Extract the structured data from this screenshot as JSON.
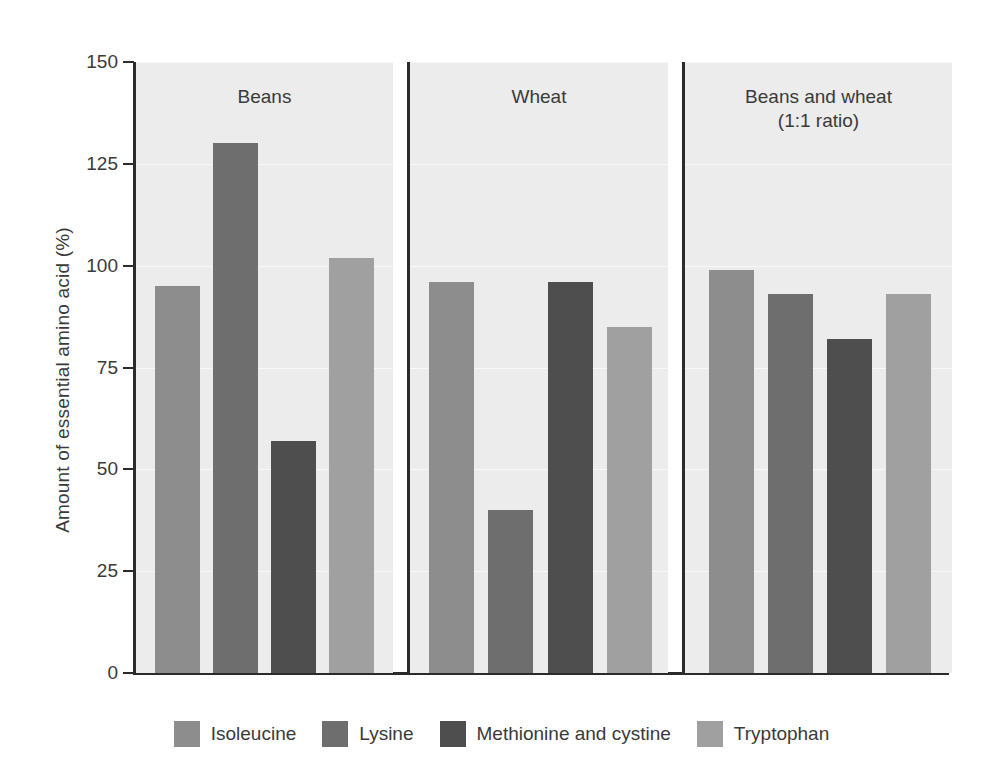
{
  "chart_data": {
    "type": "bar",
    "title": "",
    "xlabel": "",
    "ylabel": "Amount of essential amino acid (%)",
    "ylim": [
      0,
      150
    ],
    "yticks": [
      0,
      25,
      50,
      75,
      100,
      125,
      150
    ],
    "ytick_labels": [
      "0",
      "25",
      "50",
      "75",
      "100",
      "125",
      "150"
    ],
    "grid": true,
    "grid_axis": "y",
    "legend_position": "bottom",
    "panels": [
      "Beans",
      "Wheat",
      "Beans and wheat\n(1:1 ratio)"
    ],
    "categories": [
      "Beans",
      "Wheat",
      "Beans and wheat (1:1 ratio)"
    ],
    "series": [
      {
        "name": "Isoleucine",
        "color": "#8d8d8d",
        "values": [
          95,
          96,
          99
        ]
      },
      {
        "name": "Lysine",
        "color": "#6e6e6e",
        "values": [
          130,
          40,
          93
        ]
      },
      {
        "name": "Methionine and cystine",
        "color": "#4e4e4e",
        "values": [
          57,
          96,
          82
        ]
      },
      {
        "name": "Tryptophan",
        "color": "#a0a0a0",
        "values": [
          102,
          85,
          93
        ]
      }
    ]
  },
  "axis": {
    "y_title": "Amount of essential amino acid (%)",
    "y_tick_labels": [
      "150",
      "125",
      "100",
      "75",
      "50",
      "25",
      "0"
    ]
  },
  "panels": [
    {
      "title": "Beans"
    },
    {
      "title": "Wheat"
    },
    {
      "title": "Beans and wheat\n(1:1 ratio)"
    }
  ],
  "legend": {
    "items": [
      {
        "label": "Isoleucine",
        "color": "#8d8d8d"
      },
      {
        "label": "Lysine",
        "color": "#6e6e6e"
      },
      {
        "label": "Methionine and cystine",
        "color": "#4e4e4e"
      },
      {
        "label": "Tryptophan",
        "color": "#a0a0a0"
      }
    ]
  },
  "colors": {
    "background": "#ffffff",
    "panel_background": "#ececec",
    "axis": "#2b2b2b",
    "gridline": "#f8f8f8",
    "text": "#3a3a3a"
  }
}
